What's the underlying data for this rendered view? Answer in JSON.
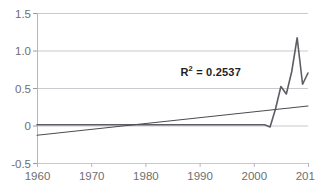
{
  "chart_data": {
    "type": "line",
    "title": "",
    "xlabel": "",
    "ylabel": "",
    "xlim": [
      1960,
      2010
    ],
    "ylim": [
      -0.5,
      1.5
    ],
    "grid": true,
    "legend": false,
    "xticks": [
      "1960",
      "1970",
      "1980",
      "1990",
      "2000",
      "2010"
    ],
    "yticks": [
      "1.5",
      "1.0",
      "0.5",
      "0",
      "-0.5"
    ],
    "annotations": [
      {
        "text": "R² = 0.2537",
        "base": "R",
        "sup": "2",
        "rest": "= 0.2537",
        "x": 1992,
        "y": 0.73
      }
    ],
    "series": [
      {
        "name": "data",
        "color": "#5d5d66",
        "x": [
          1960,
          1965,
          1970,
          1975,
          1980,
          1985,
          1990,
          1995,
          2000,
          2002,
          2003,
          2004,
          2005,
          2006,
          2007,
          2008,
          2009,
          2010
        ],
        "values": [
          0.01,
          0.01,
          0.01,
          0.01,
          0.01,
          0.01,
          0.01,
          0.01,
          0.01,
          0.01,
          -0.02,
          0.22,
          0.52,
          0.42,
          0.72,
          1.17,
          0.55,
          0.7
        ]
      },
      {
        "name": "trendline",
        "color": "#4a4a52",
        "x": [
          1960,
          2010
        ],
        "values": [
          -0.13,
          0.26
        ]
      }
    ]
  },
  "axes": {
    "plot_left_px": 37,
    "plot_right_px": 308,
    "plot_top_px": 13,
    "plot_bottom_px": 163
  }
}
